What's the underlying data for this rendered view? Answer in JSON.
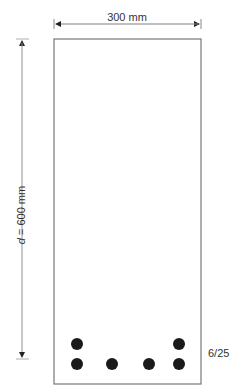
{
  "diagram": {
    "type": "beam-cross-section",
    "width_label": "300 mm",
    "depth_label_var": "d",
    "depth_label_rest": " = 600 mm",
    "reinforcement_label": "6/25",
    "colors": {
      "outline": "#777777",
      "dimension": "#888888",
      "bar": "#1a1a1a",
      "text": "#333333"
    },
    "section": {
      "x": 54,
      "y": 39,
      "w": 147,
      "h": 345
    },
    "bars": [
      {
        "cx": 77,
        "cy": 344
      },
      {
        "cx": 179,
        "cy": 344
      },
      {
        "cx": 77,
        "cy": 364
      },
      {
        "cx": 112,
        "cy": 364
      },
      {
        "cx": 149,
        "cy": 364
      },
      {
        "cx": 179,
        "cy": 364
      }
    ],
    "bar_radius": 6
  }
}
